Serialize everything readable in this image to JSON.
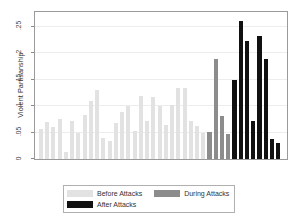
{
  "chart_data": {
    "type": "bar",
    "title": "",
    "subtitle": "",
    "xlabel": "",
    "ylabel": "Violent Partisanship",
    "ylim": [
      0,
      0.2775
    ],
    "yticks": [
      0,
      0.05,
      0.1,
      0.15,
      0.2,
      0.25
    ],
    "ytick_labels": [
      "0",
      ".05",
      ".1",
      ".15",
      ".2",
      ".25"
    ],
    "xticks": [],
    "xtick_labels": [],
    "grid": "horizontal",
    "legend_position": "bottom",
    "series": [
      {
        "name": "Before Attacks",
        "color": "#e2e2e2",
        "values": [
          0.057,
          0.069,
          0.06,
          0.075,
          0.014,
          0.072,
          0.05,
          0.083,
          0.11,
          0.13,
          0.039,
          0.034,
          0.068,
          0.089,
          0.1,
          0.053,
          0.119,
          0.071,
          0.117,
          0.1,
          0.065,
          0.102,
          0.135,
          0.134,
          0.072,
          0.063,
          0.049
        ]
      },
      {
        "name": "During Attacks",
        "color": "#8c8c8c",
        "values": [
          0.051,
          0.188,
          0.081,
          0.048
        ]
      },
      {
        "name": "After Attacks",
        "color": "#111111",
        "values": [
          0.15,
          0.261,
          0.222,
          0.072,
          0.232,
          0.188,
          0.037,
          0.03
        ]
      }
    ]
  },
  "legend": {
    "entries": [
      {
        "label": "Before Attacks",
        "color": "#e2e2e2"
      },
      {
        "label": "During Attacks",
        "color": "#8c8c8c"
      },
      {
        "label": "After Attacks",
        "color": "#111111"
      }
    ]
  }
}
